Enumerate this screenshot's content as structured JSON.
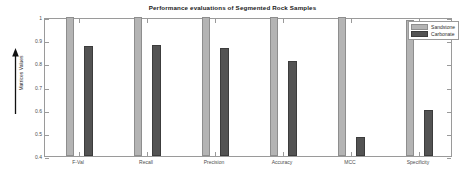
{
  "chart_data": {
    "type": "bar",
    "title": "Performance evaluations of Segmented Rock Samples",
    "xlabel": "",
    "ylabel": "Matrices Values",
    "categories": [
      "F-Val",
      "Recall",
      "Precision",
      "Accuracy",
      "MCC",
      "Specificity"
    ],
    "series": [
      {
        "name": "Sandstone",
        "color": "#b4b4b4",
        "values": [
          1.0,
          1.0,
          1.0,
          1.0,
          0.999,
          0.988
        ]
      },
      {
        "name": "Carbonate",
        "color": "#535353",
        "values": [
          0.873,
          0.881,
          0.867,
          0.812,
          0.483,
          0.598
        ]
      }
    ],
    "ylim": [
      0.4,
      1.0
    ],
    "yticks": [
      0.4,
      0.5,
      0.6,
      0.7,
      0.8,
      0.9,
      1.0
    ],
    "ytick_labels": [
      "0.4",
      "0.5",
      "0.6",
      "0.7",
      "0.8",
      "0.9",
      "1"
    ],
    "grid": false,
    "legend_position": "top-right",
    "y_axis_arrow": "up-arrow-icon"
  }
}
